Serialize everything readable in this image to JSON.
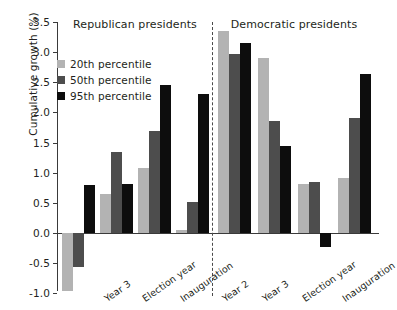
{
  "chart_data": {
    "type": "bar",
    "title": "",
    "xlabel": "",
    "ylabel": "Cumulative growth (%)",
    "ylim": [
      -1.0,
      3.5
    ],
    "ytick_labels": [
      "3.5",
      "3.0",
      "2.5",
      "2.0",
      "1.5",
      "1.0",
      "0.5",
      "0.0",
      "-0.5",
      "-1.0"
    ],
    "ytick_values": [
      3.5,
      3.0,
      2.5,
      2.0,
      1.5,
      1.0,
      0.5,
      0.0,
      -0.5,
      -1.0
    ],
    "grid": false,
    "legend_position": "upper left",
    "panels": [
      {
        "name": "Republican presidents",
        "categories": [
          "",
          "Year 3",
          "Election year",
          "Inauguration"
        ]
      },
      {
        "name": "Democratic presidents",
        "categories": [
          "Year 2",
          "Year 3",
          "Election year",
          "Inauguration"
        ]
      }
    ],
    "categories": [
      "",
      "Year 3",
      "Election year",
      "Inauguration",
      "Year 2",
      "Year 3",
      "Election year",
      "Inauguration"
    ],
    "series": [
      {
        "name": "20th percentile",
        "color": "#b3b3b3",
        "values": [
          -0.97,
          0.64,
          1.07,
          0.05,
          3.35,
          2.9,
          0.82,
          0.92
        ]
      },
      {
        "name": "50th percentile",
        "color": "#4d4d4d",
        "values": [
          -0.57,
          1.34,
          1.7,
          0.52,
          2.97,
          1.86,
          0.85,
          1.9
        ]
      },
      {
        "name": "95th percentile",
        "color": "#0d0d0d",
        "values": [
          0.8,
          0.81,
          2.45,
          2.31,
          3.15,
          1.44,
          -0.23,
          2.63
        ]
      }
    ]
  },
  "legend": {
    "items": [
      {
        "label": "20th percentile",
        "color": "#b3b3b3"
      },
      {
        "label": "50th percentile",
        "color": "#4d4d4d"
      },
      {
        "label": "95th percentile",
        "color": "#0d0d0d"
      }
    ]
  }
}
